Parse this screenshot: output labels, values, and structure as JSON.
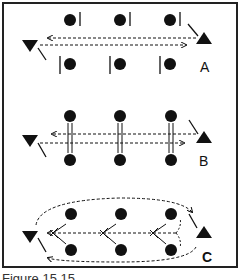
{
  "figure": {
    "panels": [
      {
        "label": "A",
        "description": "Offset players with single markers; passes exchanged between two end triangles"
      },
      {
        "label": "B",
        "description": "Paired players with double-line connectors; passes exchanged between two end triangles"
      },
      {
        "label": "C",
        "description": "Paired players with crossing lines; passes around the outside and through the middle"
      }
    ],
    "caption": "Figure 15.15"
  },
  "colors": {
    "ink": "#111111",
    "border": "#222222",
    "background": "#ffffff"
  }
}
